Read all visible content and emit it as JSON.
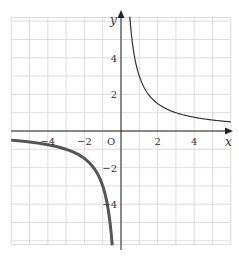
{
  "chart_data": {
    "type": "line",
    "title": "",
    "xlabel": "x",
    "ylabel": "y",
    "origin_label": "O",
    "xlim": [
      -6,
      6
    ],
    "ylim": [
      -6,
      6
    ],
    "grid": true,
    "x_ticks": [
      -4,
      -2,
      2,
      4
    ],
    "y_ticks": [
      4,
      2,
      -2,
      -4
    ],
    "x_tick_labels": [
      "−4",
      "−2",
      "2",
      "4"
    ],
    "y_tick_labels": [
      "4",
      "2",
      "−2",
      "−4"
    ],
    "series": [
      {
        "name": "branch x>0",
        "function": "y = 3/x",
        "x_range": [
          0.5,
          6
        ],
        "points": [
          [
            0.5,
            6
          ],
          [
            1,
            3
          ],
          [
            2,
            1.5
          ],
          [
            3,
            1
          ],
          [
            4,
            0.75
          ],
          [
            6,
            0.5
          ]
        ],
        "style": "thin"
      },
      {
        "name": "branch x<0",
        "function": "y = 3/x",
        "x_range": [
          -6,
          -0.5
        ],
        "points": [
          [
            -6,
            -0.5
          ],
          [
            -4,
            -0.75
          ],
          [
            -3,
            -1
          ],
          [
            -2,
            -1.5
          ],
          [
            -1,
            -3
          ],
          [
            -0.5,
            -6
          ]
        ],
        "style": "bold"
      }
    ]
  }
}
